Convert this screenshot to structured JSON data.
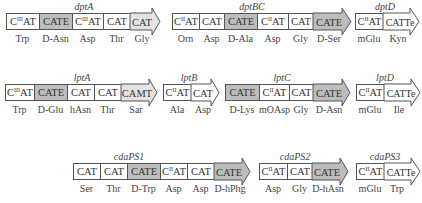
{
  "figure": {
    "legend_colors": {
      "plain": "#ffffff",
      "epimerization": "#bdbdbd",
      "terminal_light": "#e3e3e3",
      "border": "#555555"
    },
    "rows": [
      {
        "operons": [
          {
            "name": "dptA",
            "domains": [
              "C^III AT",
              "CATE",
              "C^III AT",
              "CAT",
              "CAT"
            ],
            "shades": [
              "plain",
              "shade",
              "plain",
              "plain",
              "light"
            ],
            "substrates": [
              "Trp",
              "D-Asn",
              "Asp",
              "Thr",
              "Gly"
            ]
          },
          {
            "name": "dptBC",
            "domains": [
              "C^II AT",
              "CAT",
              "CATE",
              "C^II AT",
              "CAT",
              "CATE"
            ],
            "shades": [
              "plain",
              "plain",
              "shade",
              "plain",
              "plain",
              "shade"
            ],
            "substrates": [
              "Orn",
              "Asp",
              "D-Ala",
              "Asp",
              "Gly",
              "D-Ser"
            ]
          },
          {
            "name": "dptD",
            "domains": [
              "C^II AT",
              "CATTe"
            ],
            "shades": [
              "plain",
              "plain"
            ],
            "substrates": [
              "mGlu",
              "Kyn"
            ]
          }
        ]
      },
      {
        "operons": [
          {
            "name": "lptA",
            "domains": [
              "C^III AT",
              "CATE",
              "CAT",
              "CAT",
              "CAMT"
            ],
            "shades": [
              "plain",
              "shade",
              "plain",
              "plain",
              "light"
            ],
            "substrates": [
              "Trp",
              "D-Glu",
              "hAsn",
              "Thr",
              "Sar"
            ]
          },
          {
            "name": "lptB",
            "domains": [
              "C^II AT",
              "CAT"
            ],
            "shades": [
              "plain",
              "plain"
            ],
            "substrates": [
              "Ala",
              "Asp"
            ]
          },
          {
            "name": "lptC",
            "domains": [
              "CATE",
              "C^II AT",
              "CAT",
              "CATE"
            ],
            "shades": [
              "shade",
              "plain",
              "plain",
              "shade"
            ],
            "substrates": [
              "D-Lys",
              "mOAsp",
              "Gly",
              "D-Asn"
            ]
          },
          {
            "name": "lptD",
            "domains": [
              "C^II AT",
              "CATTe"
            ],
            "shades": [
              "plain",
              "plain"
            ],
            "substrates": [
              "mGlu",
              "Ile"
            ]
          }
        ]
      },
      {
        "operons": [
          {
            "name": "cdaPS1",
            "domains": [
              "CAT",
              "CAT",
              "CATE",
              "C^II AT",
              "CAT",
              "CATE"
            ],
            "shades": [
              "plain",
              "plain",
              "shade",
              "plain",
              "plain",
              "shade"
            ],
            "substrates": [
              "Ser",
              "Thr",
              "D-Trp",
              "Asp",
              "Asp",
              "D-hPhg"
            ]
          },
          {
            "name": "cdaPS2",
            "domains": [
              "C^II AT",
              "CAT",
              "CATE"
            ],
            "shades": [
              "plain",
              "plain",
              "shade"
            ],
            "substrates": [
              "Asp",
              "Gly",
              "D-hAsn"
            ]
          },
          {
            "name": "cdaPS3",
            "domains": [
              "C^II AT",
              "CATTe"
            ],
            "shades": [
              "plain",
              "plain"
            ],
            "substrates": [
              "mGlu",
              "Trp"
            ]
          }
        ]
      }
    ]
  },
  "titles": {
    "dptA": "dptA",
    "dptBC": "dptBC",
    "dptD": "dptD",
    "lptA": "lptA",
    "lptB": "lptB",
    "lptC": "lptC",
    "lptD": "lptD",
    "cdaPS1": "cdaPS1",
    "cdaPS2": "cdaPS2",
    "cdaPS3": "cdaPS3"
  },
  "text": {
    "CAT": "CAT",
    "CATE": "CATE",
    "CAMT": "CAMT",
    "CATTe": "CATTe",
    "AT": "AT",
    "sup_III": "III",
    "sup_II": "II",
    "C": "C",
    "sub": {
      "Trp": "Trp",
      "DAsn": "D-Asn",
      "Asp": "Asp",
      "Thr": "Thr",
      "Gly": "Gly",
      "Orn": "Orn",
      "DAla": "D-Ala",
      "DSer": "D-Ser",
      "mGlu": "mGlu",
      "Kyn": "Kyn",
      "DGlu": "D-Glu",
      "hAsn": "hAsn",
      "Sar": "Sar",
      "Ala": "Ala",
      "DLys": "D-Lys",
      "mOAsp": "mOAsp",
      "Ile": "Ile",
      "Ser": "Ser",
      "DTrp": "D-Trp",
      "DhPhg": "D-hPhg",
      "DhAsn": "D-hAsn"
    }
  }
}
